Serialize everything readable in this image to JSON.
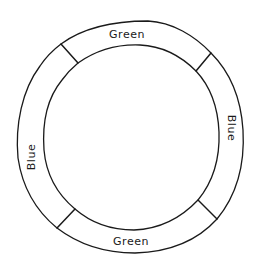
{
  "diagram": {
    "type": "segmented-ring",
    "stroke_color": "#1a1a1a",
    "background": "#ffffff",
    "segments": [
      {
        "position": "top",
        "label": "Green"
      },
      {
        "position": "right",
        "label": "Blue"
      },
      {
        "position": "bottom",
        "label": "Green"
      },
      {
        "position": "left",
        "label": "Blue"
      }
    ]
  }
}
